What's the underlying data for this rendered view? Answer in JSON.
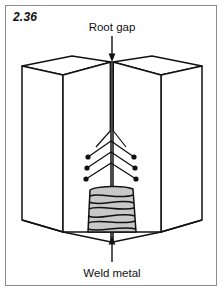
{
  "figure": {
    "number": "2.36",
    "type": "welding-joint-isometric-diagram"
  },
  "labels": {
    "top": "Root gap",
    "bottom": "Weld metal"
  },
  "annotations": [
    {
      "name": "root-gap-callout",
      "text": "Root gap",
      "arrow_direction": "down",
      "points_to": "joint-apex"
    },
    {
      "name": "weld-metal-callout",
      "text": "Weld metal",
      "arrow_direction": "up",
      "points_to": "weld-bead-stack"
    }
  ],
  "diagram": {
    "left_block_name": "left-plate",
    "right_block_name": "right-plate",
    "joint_type": "butt-joint",
    "gap_line_name": "root-gap-line",
    "weave_pass_rows": 3,
    "electrode_dots_per_side": 3,
    "weld_bead_count": 7
  },
  "colors": {
    "frame": "#8d8d8d",
    "line": "#111111",
    "bead_fill": "#c8c8c8",
    "block_face": "#ffffff",
    "background": "#ffffff"
  }
}
